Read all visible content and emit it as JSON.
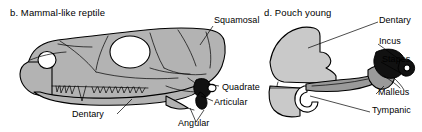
{
  "figure": {
    "background_color": "#ffffff",
    "ink_color": "#000000",
    "bone_fill_color": "#b3b3b3",
    "ossicle_fill_color": "#111111",
    "tympanic_fill_color": "#9a9a9a"
  },
  "panels": [
    {
      "id": "b",
      "title": "b. Mammal-like reptile",
      "labels": [
        {
          "key": "squamosal",
          "text": "Squamosal"
        },
        {
          "key": "quadrate",
          "text": "Quadrate"
        },
        {
          "key": "articular",
          "text": "Articular"
        },
        {
          "key": "angular",
          "text": "Angular"
        },
        {
          "key": "dentary",
          "text": "Dentary"
        }
      ]
    },
    {
      "id": "d",
      "title": "d. Pouch young",
      "labels": [
        {
          "key": "dentary",
          "text": "Dentary"
        },
        {
          "key": "incus",
          "text": "Incus"
        },
        {
          "key": "stapes",
          "text": "Stapes"
        },
        {
          "key": "malleus",
          "text": "Malleus"
        },
        {
          "key": "tympanic",
          "text": "Tympanic"
        }
      ]
    }
  ]
}
